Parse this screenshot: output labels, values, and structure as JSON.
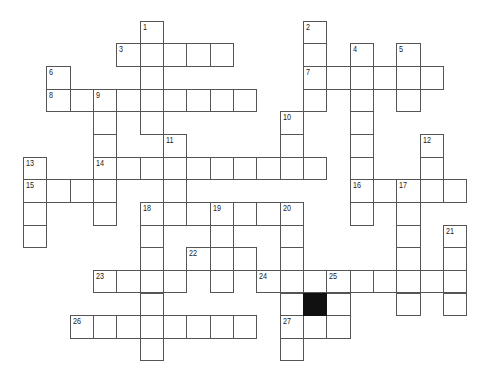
{
  "puzzle": {
    "type": "crossword",
    "grid_origin": {
      "x": 23,
      "y": 20.7
    },
    "cell_size": {
      "w": 23.33,
      "h": 22.65
    },
    "colors": {
      "border": "#555555",
      "fill": "#ffffff",
      "block": "#111111",
      "number": "#222222"
    },
    "entries": [
      {
        "number": "1",
        "dir": "down",
        "col": 5,
        "row": 0,
        "length": 5
      },
      {
        "number": "2",
        "dir": "down",
        "col": 12,
        "row": 0,
        "length": 4
      },
      {
        "number": "3",
        "dir": "across",
        "col": 4,
        "row": 1,
        "length": 5
      },
      {
        "number": "4",
        "dir": "down",
        "col": 14,
        "row": 1,
        "length": 8
      },
      {
        "number": "5",
        "dir": "down",
        "col": 16,
        "row": 1,
        "length": 3
      },
      {
        "number": "6",
        "dir": "down",
        "col": 1,
        "row": 2,
        "length": 2
      },
      {
        "number": "7",
        "dir": "across",
        "col": 12,
        "row": 2,
        "length": 6
      },
      {
        "number": "8",
        "dir": "across",
        "col": 1,
        "row": 3,
        "length": 9
      },
      {
        "number": "9",
        "dir": "down",
        "col": 3,
        "row": 3,
        "length": 6
      },
      {
        "number": "10",
        "dir": "down",
        "col": 11,
        "row": 4,
        "length": 3
      },
      {
        "number": "11",
        "dir": "down",
        "col": 6,
        "row": 5,
        "length": 4
      },
      {
        "number": "12",
        "dir": "down",
        "col": 17,
        "row": 5,
        "length": 3
      },
      {
        "number": "13",
        "dir": "down",
        "col": 0,
        "row": 6,
        "length": 4
      },
      {
        "number": "14",
        "dir": "across",
        "col": 3,
        "row": 6,
        "length": 10
      },
      {
        "number": "15",
        "dir": "across",
        "col": 0,
        "row": 7,
        "length": 4
      },
      {
        "number": "16",
        "dir": "across",
        "col": 14,
        "row": 7,
        "length": 5
      },
      {
        "number": "17",
        "dir": "down",
        "col": 16,
        "row": 7,
        "length": 6
      },
      {
        "number": "18",
        "dir": "across",
        "col": 5,
        "row": 8,
        "length": 7
      },
      {
        "number": "18",
        "dir": "down",
        "col": 5,
        "row": 8,
        "length": 7
      },
      {
        "number": "19",
        "dir": "down",
        "col": 8,
        "row": 8,
        "length": 4
      },
      {
        "number": "20",
        "dir": "down",
        "col": 11,
        "row": 8,
        "length": 7
      },
      {
        "number": "21",
        "dir": "down",
        "col": 18,
        "row": 9,
        "length": 4
      },
      {
        "number": "22",
        "dir": "across",
        "col": 7,
        "row": 10,
        "length": 3
      },
      {
        "number": "23",
        "dir": "across",
        "col": 3,
        "row": 11,
        "length": 4
      },
      {
        "number": "24",
        "dir": "across",
        "col": 10,
        "row": 11,
        "length": 9
      },
      {
        "number": "25",
        "dir": "down",
        "col": 13,
        "row": 11,
        "length": 3
      },
      {
        "number": "26",
        "dir": "across",
        "col": 2,
        "row": 13,
        "length": 8
      },
      {
        "number": "27",
        "dir": "across",
        "col": 11,
        "row": 13,
        "length": 3
      }
    ],
    "black_cells": [
      {
        "col": 12,
        "row": 12
      }
    ]
  }
}
